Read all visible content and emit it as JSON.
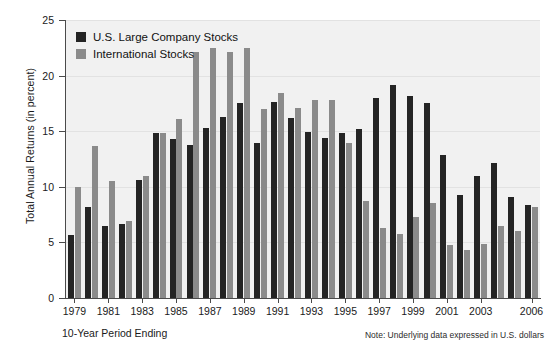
{
  "chart_data": {
    "type": "bar",
    "title": "",
    "xlabel": "10-Year Period Ending",
    "ylabel": "Total Annual Returns (in percent)",
    "ylim": [
      0,
      25
    ],
    "yticks": [
      0,
      5,
      10,
      15,
      20,
      25
    ],
    "grid": true,
    "legend_position": "upper-left",
    "note": "Note: Underlying data expressed in U.S. dollars",
    "categories": [
      "1979",
      "1980",
      "1981",
      "1982",
      "1983",
      "1984",
      "1985",
      "1986",
      "1987",
      "1988",
      "1989",
      "1990",
      "1991",
      "1992",
      "1993",
      "1994",
      "1995",
      "1996",
      "1997",
      "1998",
      "1999",
      "2000",
      "2001",
      "2002",
      "2003",
      "2004",
      "2005",
      "2006"
    ],
    "xtick_labels": [
      "1979",
      "",
      "1981",
      "",
      "1983",
      "",
      "1985",
      "",
      "1987",
      "",
      "1989",
      "",
      "1991",
      "",
      "1993",
      "",
      "1995",
      "",
      "1997",
      "",
      "1999",
      "",
      "2001",
      "",
      "2003",
      "",
      "",
      "2006"
    ],
    "series": [
      {
        "name": "U.S. Large Company Stocks",
        "color": "#242424",
        "values": [
          5.7,
          8.2,
          6.5,
          6.7,
          10.6,
          14.8,
          14.3,
          13.8,
          15.3,
          16.3,
          17.5,
          13.9,
          17.6,
          16.2,
          14.9,
          14.4,
          14.8,
          15.2,
          18.0,
          19.2,
          18.2,
          17.5,
          12.9,
          9.3,
          11.0,
          12.1,
          9.1,
          8.4
        ]
      },
      {
        "name": "International Stocks",
        "color": "#8b8b8b",
        "values": [
          10.0,
          13.7,
          10.5,
          6.9,
          11.0,
          14.8,
          16.1,
          22.1,
          22.5,
          22.1,
          22.5,
          17.0,
          18.4,
          17.1,
          17.8,
          17.8,
          13.9,
          8.7,
          6.3,
          5.8,
          7.3,
          8.5,
          4.8,
          4.3,
          4.9,
          6.5,
          6.0,
          8.2
        ]
      }
    ]
  },
  "legend": {
    "items": [
      {
        "label": "U.S. Large Company Stocks",
        "color": "#242424"
      },
      {
        "label": "International Stocks",
        "color": "#8b8b8b"
      }
    ]
  },
  "axes": {
    "y_title": "Total Annual Returns (in percent)",
    "x_title": "10-Year Period Ending"
  },
  "footnote": "Note: Underlying data expressed in U.S. dollars"
}
